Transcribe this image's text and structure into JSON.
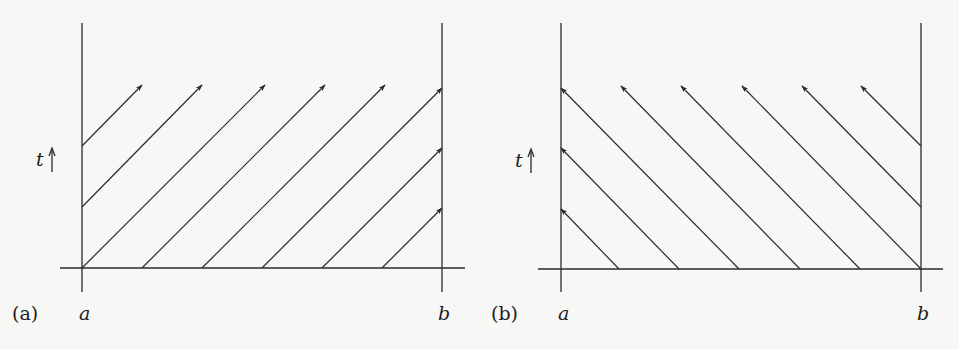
{
  "figure": {
    "background": "#f7f7f5",
    "ink": "#2a2a2a",
    "panels": [
      {
        "id": "a",
        "panel_label": "(a)",
        "left_label": "a",
        "right_label": "b",
        "time_label": "t",
        "direction": "right-moving",
        "left_wall_x": 82,
        "right_wall_x": 442,
        "axis_y": 268,
        "top_y": 23,
        "bottom_y": 292,
        "axis_x0": 60,
        "axis_x1": 465,
        "tip_y": 85,
        "lines": [
          {
            "x0": 82,
            "y0": 146,
            "x1": 142,
            "y1": 85
          },
          {
            "x0": 82,
            "y0": 207,
            "x1": 202,
            "y1": 85
          },
          {
            "x0": 82,
            "y0": 268,
            "x1": 265,
            "y1": 85
          },
          {
            "x0": 142,
            "y0": 268,
            "x1": 325,
            "y1": 85
          },
          {
            "x0": 202,
            "y0": 268,
            "x1": 385,
            "y1": 85
          },
          {
            "x0": 262,
            "y0": 268,
            "x1": 442,
            "y1": 88
          },
          {
            "x0": 322,
            "y0": 268,
            "x1": 442,
            "y1": 148
          },
          {
            "x0": 382,
            "y0": 268,
            "x1": 442,
            "y1": 208
          }
        ]
      },
      {
        "id": "b",
        "panel_label": "(b)",
        "left_label": "a",
        "right_label": "b",
        "time_label": "t",
        "direction": "left-moving",
        "left_wall_x": 561,
        "right_wall_x": 921,
        "axis_y": 269,
        "top_y": 23,
        "bottom_y": 292,
        "axis_x0": 538,
        "axis_x1": 943,
        "tip_y": 86,
        "lines": [
          {
            "x0": 619,
            "y0": 269,
            "x1": 561,
            "y1": 209
          },
          {
            "x0": 679,
            "y0": 269,
            "x1": 561,
            "y1": 148
          },
          {
            "x0": 739,
            "y0": 269,
            "x1": 561,
            "y1": 88
          },
          {
            "x0": 800,
            "y0": 269,
            "x1": 621,
            "y1": 86
          },
          {
            "x0": 860,
            "y0": 269,
            "x1": 681,
            "y1": 86
          },
          {
            "x0": 921,
            "y0": 269,
            "x1": 742,
            "y1": 86
          },
          {
            "x0": 921,
            "y0": 207,
            "x1": 802,
            "y1": 86
          },
          {
            "x0": 921,
            "y0": 146,
            "x1": 861,
            "y1": 86
          }
        ]
      }
    ]
  }
}
